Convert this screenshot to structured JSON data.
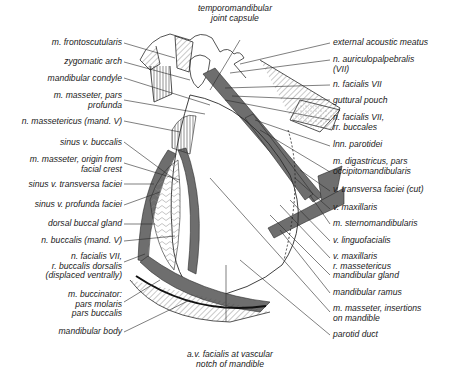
{
  "diagram": {
    "colors": {
      "line": "#2a2a2a",
      "muscle_gray": "#6e6e6e",
      "background": "#ffffff",
      "stipple": "#cfcfcf"
    },
    "top_label": {
      "line1": "temporomandibular",
      "line2": "joint capsule"
    },
    "bottom_label": {
      "line1": "a.v. facialis at vascular",
      "line2": "notch of mandible"
    },
    "left_labels": [
      {
        "line1": "m. frontoscutularis"
      },
      {
        "line1": "zygomatic arch"
      },
      {
        "line1": "mandibular condyle"
      },
      {
        "line1": "m. masseter, pars",
        "line2": "profunda"
      },
      {
        "line1": "n. massetericus (mand. V)"
      },
      {
        "line1": "sinus v. buccalis"
      },
      {
        "line1": "m. masseter, origin from",
        "line2": "facial crest"
      },
      {
        "line1": "sinus v. transversa faciei"
      },
      {
        "line1": "sinus v. profunda faciei"
      },
      {
        "line1": "dorsal buccal gland"
      },
      {
        "line1": "n. buccalis (mand. V)"
      },
      {
        "line1": "n. facialis VII,",
        "line2": "r. buccalis dorsalis",
        "line3": "(displaced ventrally)"
      },
      {
        "line1": "m. buccinator:",
        "line2": "pars molaris",
        "line3": "pars buccalis"
      },
      {
        "line1": "mandibular body"
      }
    ],
    "right_labels": [
      {
        "line1": "external acoustic meatus"
      },
      {
        "line1": "n. auriculopalpebralis",
        "line2": "(VII)"
      },
      {
        "line1": "n. facialis VII"
      },
      {
        "line1": "guttural pouch"
      },
      {
        "line1": "n. facialis VII,",
        "line2": "rr. buccales"
      },
      {
        "line1": "lnn. parotidei"
      },
      {
        "line1": "m. digastricus, pars",
        "line2": "occipitomandibularis"
      },
      {
        "line1": "v. transversa faciei (cut)"
      },
      {
        "line1": "v. maxillaris"
      },
      {
        "line1": "m. sternomandibularis"
      },
      {
        "line1": "v. linguofacialis"
      },
      {
        "line1": "v. maxillaris",
        "line2": "r. massetericus"
      },
      {
        "line1": "mandibular gland"
      },
      {
        "line1": "mandibular ramus"
      },
      {
        "line1": "m. masseter, insertions",
        "line2": "on mandible"
      },
      {
        "line1": "parotid duct"
      }
    ]
  }
}
